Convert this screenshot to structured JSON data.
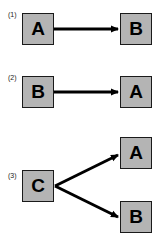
{
  "diagrams": [
    {
      "label": "(1)",
      "source": "A",
      "targets": [
        "B"
      ]
    },
    {
      "label": "(2)",
      "source": "B",
      "targets": [
        "A"
      ]
    },
    {
      "label": "(3)",
      "source": "C",
      "targets": [
        "A",
        "B"
      ]
    }
  ],
  "colors": {
    "box_fill": "#b4b4b4",
    "box_border": "#1a1a1a",
    "arrow": "#000000",
    "background": "#ffffff"
  }
}
